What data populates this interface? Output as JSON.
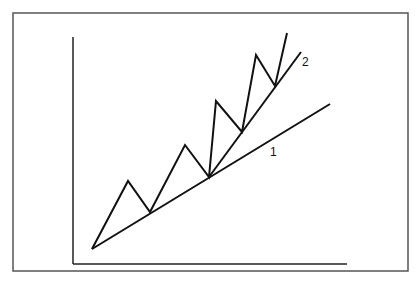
{
  "labels": {
    "line1": "1",
    "line2": "2"
  },
  "colors": {
    "line": "#111111",
    "frame": "#555555"
  }
}
